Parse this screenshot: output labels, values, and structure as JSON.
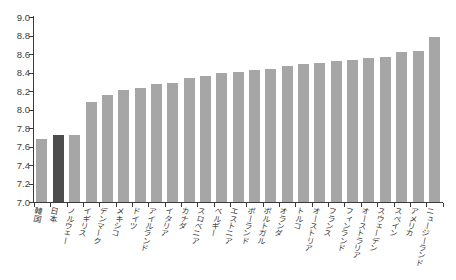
{
  "figure": {
    "background": "#ffffff",
    "title": ""
  },
  "chart_data": {
    "type": "bar",
    "title": "",
    "xlabel": "",
    "ylabel": "",
    "categories": [
      "韓国",
      "日本",
      "ノルウェー",
      "イギリス",
      "デンマーク",
      "メキシコ",
      "ドイツ",
      "アイルランド",
      "イタリア",
      "カナダ",
      "スロベニア",
      "ベルギー",
      "エストニア",
      "ポーランド",
      "ポルトガル",
      "オランダ",
      "トルコ",
      "オーストリア",
      "フランス",
      "フィンランド",
      "オーストラリア",
      "スウェーデン",
      "スペイン",
      "アメリカ",
      "ニュージーランド"
    ],
    "values": [
      7.68,
      7.72,
      7.72,
      8.08,
      8.16,
      8.21,
      8.23,
      8.28,
      8.29,
      8.34,
      8.36,
      8.4,
      8.41,
      8.43,
      8.44,
      8.47,
      8.49,
      8.5,
      8.52,
      8.53,
      8.56,
      8.57,
      8.62,
      8.63,
      8.78
    ],
    "highlight_category": "日本",
    "highlight_index": 1,
    "ylim": [
      7.0,
      9.0
    ],
    "ytick_step": 0.2,
    "ytick_labels": [
      "9.0",
      "8.8",
      "8.6",
      "8.4",
      "8.2",
      "8.0",
      "7.8",
      "7.6",
      "7.4",
      "7.2",
      "7.0"
    ],
    "grid": false,
    "legend": "none",
    "colors": {
      "bar": "#a6a6a6",
      "highlight_bar": "#4d4d4d",
      "axis": "#3a3a3a",
      "tick_text": "#404040",
      "category_text": "#3a3a3a",
      "background": "#ffffff"
    }
  }
}
